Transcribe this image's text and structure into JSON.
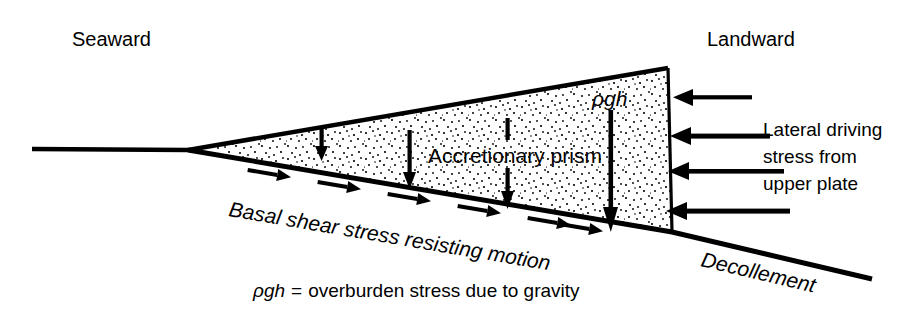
{
  "figure": {
    "type": "geological-cross-section",
    "title_visible": false,
    "background_color": "#ffffff",
    "ink_color": "#000000"
  },
  "labels": {
    "seaward": "Seaward",
    "landward": "Landward",
    "prism": "Accretionary prism",
    "overburden_symbol": "ρgh",
    "basal_shear": "Basal shear stress resisting motion",
    "decollement": "Decollement"
  },
  "side_note": {
    "lines": [
      "Lateral driving",
      "stress from",
      "upper plate"
    ]
  },
  "caption": {
    "symbol": "ρgh",
    "equals": "=",
    "text": "overburden stress due to gravity",
    "full": "ρgh = overburden stress due to gravity"
  },
  "geometry": {
    "wedge_tip": [
      188,
      150
    ],
    "top_vertex": [
      668,
      68
    ],
    "basal_right": [
      672,
      232
    ],
    "seafloor_left": [
      32,
      149
    ],
    "decollement_right": [
      872,
      279
    ]
  },
  "overburden_arrows": {
    "count": 4,
    "description": "downward arrows inside prism, length increases landward",
    "items": [
      {
        "x": 322,
        "y_top": 128,
        "y_bottom": 160
      },
      {
        "x": 410,
        "y_top": 130,
        "y_bottom": 188
      },
      {
        "x": 508,
        "y_top": 118,
        "y_bottom": 208,
        "split_by_label": true
      },
      {
        "x": 611,
        "y_top": 108,
        "y_bottom": 231
      }
    ]
  },
  "lateral_arrows": {
    "count": 4,
    "direction": "leftward",
    "description": "lateral driving stress arrows pushing the backstop",
    "items": [
      {
        "y": 97,
        "x_tail": 752,
        "x_head": 673
      },
      {
        "y": 136,
        "x_tail": 770,
        "x_head": 670
      },
      {
        "y": 171,
        "x_tail": 784,
        "x_head": 668
      },
      {
        "y": 211,
        "x_tail": 790,
        "x_head": 666
      }
    ]
  },
  "shear_arrows": {
    "count": 6,
    "direction": "downslope-right",
    "description": "half-barb shear arrows along the decollement"
  },
  "stipple": {
    "description": "random dot fill representing sediment of the accretionary prism",
    "dot_color": "#000000"
  }
}
